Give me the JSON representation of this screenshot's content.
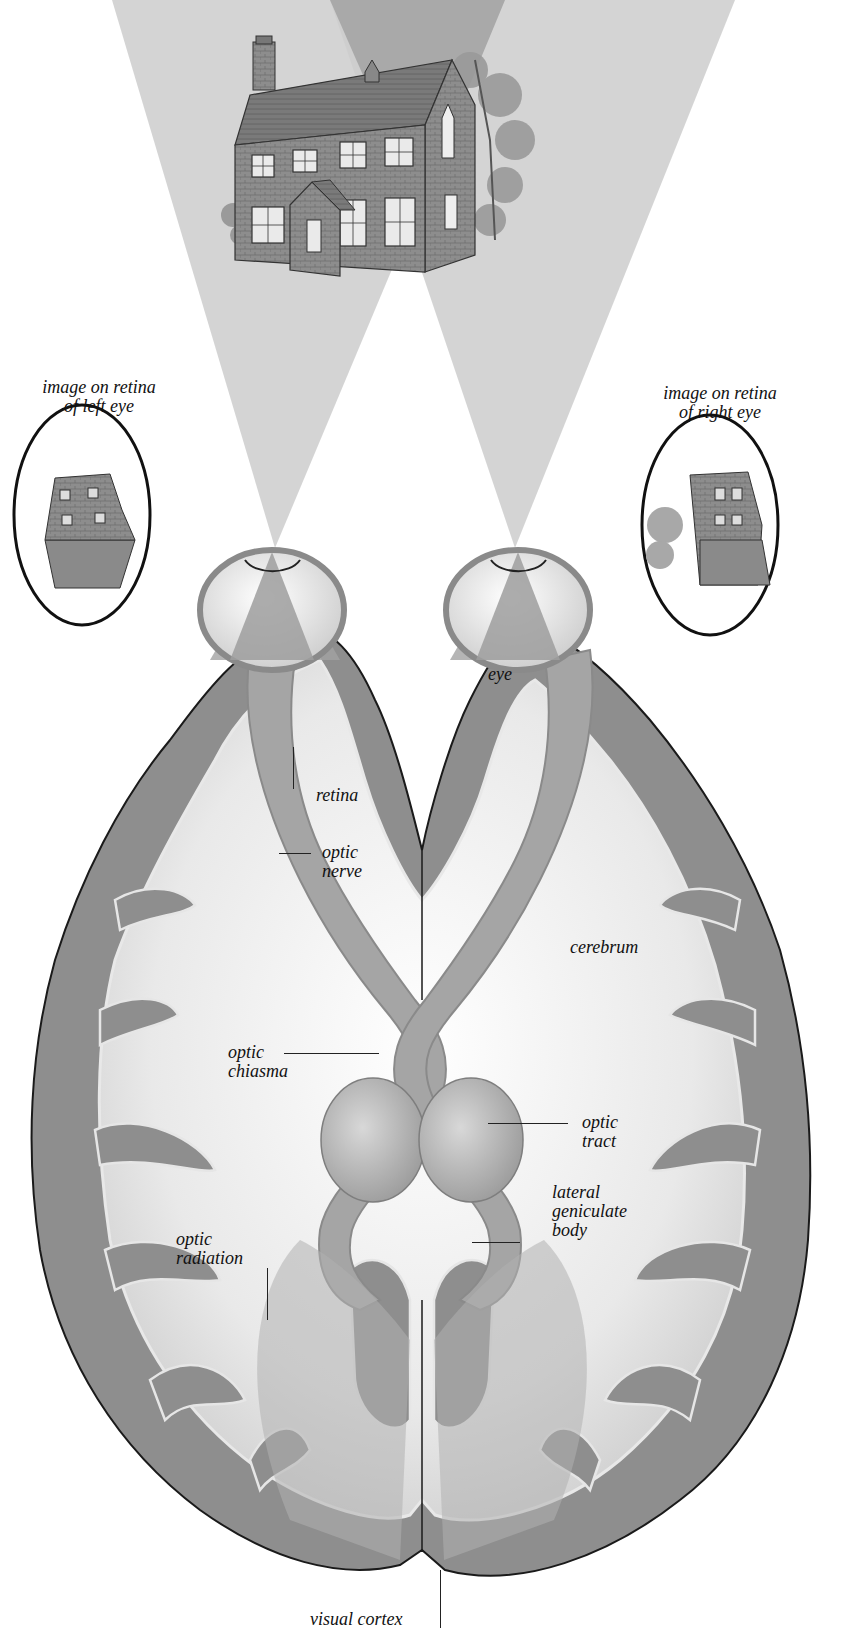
{
  "figure": {
    "colors": {
      "background": "#ffffff",
      "cone": "#c9c9c9",
      "cone_overlap": "#a8a8a8",
      "cortex_gray_matter": "#8e8e8e",
      "white_matter": "#f1f1f1",
      "optic_pathway": "#a5a5a5",
      "thalamus": "#b7b7b7",
      "outline": "#1a1a1a",
      "label_text": "#111111"
    }
  },
  "labels": {
    "left_retina_image": {
      "line1": "image on retina",
      "line2": "of left eye"
    },
    "right_retina_image": {
      "line1": "image on retina",
      "line2": "of right eye"
    },
    "eye": "eye",
    "retina": "retina",
    "optic_nerve": {
      "line1": "optic",
      "line2": "nerve"
    },
    "cerebrum": "cerebrum",
    "optic_chiasma": {
      "line1": "optic",
      "line2": "chiasma"
    },
    "optic_tract": {
      "line1": "optic",
      "line2": "tract"
    },
    "lateral_geniculate_body": {
      "line1": "lateral",
      "line2": "geniculate",
      "line3": "body"
    },
    "optic_radiation": {
      "line1": "optic",
      "line2": "radiation"
    },
    "visual_cortex": "visual cortex"
  },
  "pictorial_elements": {
    "top": "house-illustration",
    "left_inset": "inverted-house-left-retina",
    "right_inset": "inverted-house-right-retina"
  }
}
